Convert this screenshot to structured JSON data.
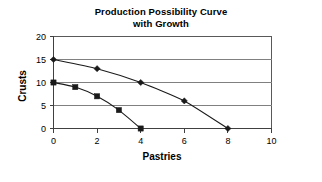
{
  "chart_data": {
    "type": "line",
    "title": "Production Possibility Curve with Growth",
    "title_lines": [
      "Production Possibility Curve",
      "with Growth"
    ],
    "xlabel": "Pastries",
    "ylabel": "Crusts",
    "xlim": [
      0,
      10
    ],
    "ylim": [
      0,
      20
    ],
    "xticks": [
      0,
      2,
      4,
      6,
      8,
      10
    ],
    "yticks": [
      0,
      5,
      10,
      15,
      20
    ],
    "xtick_labels": [
      "0",
      "2",
      "4",
      "6",
      "8",
      "10"
    ],
    "ytick_labels": [
      "0",
      "5",
      "10",
      "15",
      "20"
    ],
    "grid": "horizontal",
    "legend": "none",
    "series": [
      {
        "name": "Curve with Growth",
        "marker": "diamond",
        "color": "#1a1a1a",
        "x": [
          0,
          2,
          4,
          6,
          8
        ],
        "values": [
          15,
          13,
          10,
          6,
          0
        ]
      },
      {
        "name": "Original Curve",
        "marker": "square",
        "color": "#1a1a1a",
        "x": [
          0,
          1,
          2,
          3,
          4
        ],
        "values": [
          10,
          9,
          7,
          4,
          0
        ]
      }
    ]
  },
  "colors": {
    "background": "#ffffff",
    "gridline": "#808080",
    "axis": "#404040",
    "series": "#1a1a1a",
    "text": "#000000"
  }
}
